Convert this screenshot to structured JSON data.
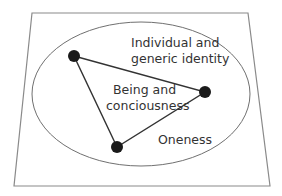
{
  "diagram": {
    "labels": {
      "outer_top_line1": "Individual and",
      "outer_top_line2": "generic identity",
      "center_line1": "Being and",
      "center_line2": "conciousness",
      "bottom": "Oneness"
    },
    "colors": {
      "frame": "#8a8a8a",
      "ellipse": "#707070",
      "triangle": "#333333",
      "node": "#1a1a1a",
      "text": "#333333"
    }
  }
}
